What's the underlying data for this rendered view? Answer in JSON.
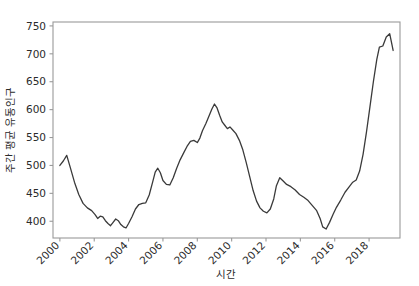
{
  "chart_data": {
    "type": "line",
    "title": "",
    "xlabel": "시간",
    "ylabel": "주간 평균 유동인구",
    "xlim": [
      1999.6,
      2019.8
    ],
    "ylim": [
      370,
      757
    ],
    "grid": false,
    "legend": null,
    "xticks": [
      2000,
      2002,
      2004,
      2006,
      2008,
      2010,
      2012,
      2014,
      2016,
      2018
    ],
    "xtick_labels": [
      "2000",
      "2002",
      "2004",
      "2006",
      "2008",
      "2010",
      "2012",
      "2014",
      "2016",
      "2018"
    ],
    "xtick_rotation": 45,
    "yticks": [
      400,
      450,
      500,
      550,
      600,
      650,
      700,
      750
    ],
    "ytick_labels": [
      "400",
      "450",
      "500",
      "550",
      "600",
      "650",
      "700",
      "750"
    ],
    "line_color": "#3a3a3a",
    "line_width": 1.3,
    "series": [
      {
        "name": "주간 평균 유동인구",
        "x": [
          2000.0,
          2000.2,
          2000.4,
          2000.6,
          2000.85,
          2001.1,
          2001.35,
          2001.6,
          2001.85,
          2002.05,
          2002.2,
          2002.35,
          2002.5,
          2002.65,
          2002.8,
          2002.95,
          2003.1,
          2003.25,
          2003.4,
          2003.55,
          2003.7,
          2003.85,
          2004.0,
          2004.2,
          2004.4,
          2004.6,
          2004.8,
          2005.0,
          2005.2,
          2005.4,
          2005.55,
          2005.7,
          2005.85,
          2006.0,
          2006.2,
          2006.4,
          2006.6,
          2006.8,
          2007.0,
          2007.2,
          2007.4,
          2007.6,
          2007.8,
          2008.0,
          2008.15,
          2008.3,
          2008.5,
          2008.7,
          2008.85,
          2009.0,
          2009.15,
          2009.3,
          2009.45,
          2009.6,
          2009.75,
          2009.9,
          2010.05,
          2010.25,
          2010.45,
          2010.65,
          2010.85,
          2011.05,
          2011.25,
          2011.45,
          2011.65,
          2011.85,
          2012.05,
          2012.25,
          2012.45,
          2012.6,
          2012.8,
          2013.0,
          2013.2,
          2013.45,
          2013.7,
          2013.95,
          2014.2,
          2014.45,
          2014.7,
          2014.95,
          2015.15,
          2015.3,
          2015.5,
          2015.7,
          2015.9,
          2016.1,
          2016.35,
          2016.6,
          2016.85,
          2017.05,
          2017.25,
          2017.45,
          2017.65,
          2017.85,
          2018.05,
          2018.25,
          2018.45,
          2018.6,
          2018.8,
          2019.0,
          2019.2,
          2019.4
        ],
        "y": [
          500,
          508,
          518,
          497,
          470,
          448,
          432,
          424,
          419,
          412,
          405,
          409,
          408,
          401,
          396,
          392,
          398,
          404,
          401,
          394,
          390,
          388,
          396,
          408,
          422,
          430,
          432,
          433,
          447,
          470,
          488,
          495,
          487,
          473,
          466,
          465,
          478,
          495,
          510,
          522,
          534,
          543,
          545,
          541,
          549,
          562,
          575,
          590,
          601,
          610,
          603,
          590,
          578,
          572,
          566,
          569,
          564,
          557,
          545,
          528,
          505,
          480,
          455,
          436,
          424,
          418,
          415,
          422,
          440,
          463,
          478,
          472,
          466,
          462,
          456,
          448,
          443,
          437,
          428,
          419,
          405,
          390,
          386,
          398,
          412,
          425,
          438,
          452,
          462,
          470,
          474,
          490,
          520,
          560,
          605,
          650,
          690,
          712,
          714,
          730,
          736,
          706
        ]
      }
    ]
  }
}
